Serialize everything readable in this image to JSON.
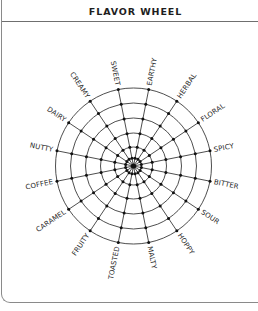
{
  "header": {
    "title": "FLAVOR WHEEL"
  },
  "wheel": {
    "center": [
      133.5,
      166
    ],
    "ring_radii": [
      78,
      63,
      48,
      33,
      19,
      8
    ],
    "line_color": "#3a3a3a",
    "node_color": "#111111",
    "label_gap": 4,
    "labels": [
      "SWEET",
      "EARTHY",
      "HERBAL",
      "FLORAL",
      "SPICY",
      "BITTER",
      "SOUR",
      "HOPPY",
      "MALTY",
      "TOASTED",
      "FRUITY",
      "CARAMEL",
      "COFFEE",
      "NUTTY",
      "DAIRY",
      "CREAMY"
    ]
  }
}
